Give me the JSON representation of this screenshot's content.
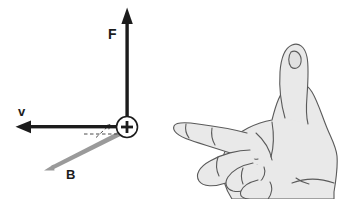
{
  "figure": {
    "background_color": "#ffffff"
  },
  "diagram": {
    "charge": {
      "name": "positive-charge",
      "symbol": "+",
      "center_x": 127,
      "center_y": 127,
      "radius": 11,
      "color": "#1c1c1c"
    },
    "vectors": [
      {
        "id": "force",
        "label": "F",
        "meaning": "magnetic force",
        "direction": "up",
        "color": "#1c1c1c",
        "label_x": 108,
        "label_y": 27,
        "from_x": 127,
        "from_y": 116,
        "to_x": 127,
        "to_y": 8
      },
      {
        "id": "velocity",
        "label": "v",
        "meaning": "charge velocity",
        "direction": "left",
        "color": "#1c1c1c",
        "label_x": 18,
        "label_y": 105,
        "from_x": 116,
        "from_y": 127,
        "to_x": 16,
        "to_y": 127
      },
      {
        "id": "magnetic-field",
        "label": "B",
        "meaning": "magnetic field",
        "direction": "down-left",
        "color": "#8e8e8e",
        "label_x": 66,
        "label_y": 168,
        "from_x": 120,
        "from_y": 133,
        "to_x": 46,
        "to_y": 168
      }
    ],
    "angle_marker": {
      "name": "angle-between-v-and-B",
      "style": "dashed",
      "color": "#555555"
    }
  },
  "hand": {
    "name": "right-hand-illustration",
    "description": "Open right hand, thumb pointing up, index finger pointing left, remaining fingers curled",
    "fill_color": "#e9e9e9",
    "outline_color": "#5a5a5a",
    "shade_color": "#d2d2d2"
  }
}
